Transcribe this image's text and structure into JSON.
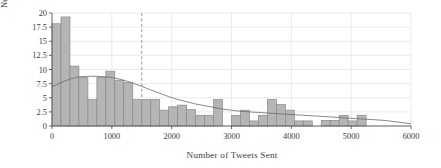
{
  "chart_data": {
    "type": "bar",
    "title": "",
    "subtitle": "",
    "xlabel": "Number of Tweets Sent",
    "ylabel": "Number of Organizations",
    "xlim": [
      0,
      6000
    ],
    "ylim": [
      0,
      20
    ],
    "xticks": [
      0,
      1000,
      2000,
      3000,
      4000,
      5000,
      6000
    ],
    "xtick_labels": [
      "0",
      "1000",
      "2000",
      "3000",
      "4000",
      "5000",
      "6000"
    ],
    "yticks": [
      0,
      2.5,
      5,
      7.5,
      10,
      12.5,
      15,
      17.5,
      20
    ],
    "ytick_labels": [
      "0",
      "2.5",
      "5",
      "7.5",
      "10",
      "12.5",
      "15",
      "17.5",
      "20"
    ],
    "grid": true,
    "grid_axis": "both",
    "bar_fill": "#b5b5b5",
    "bar_edge": "#8a8a8a",
    "curve_color": "#6b6b6b",
    "vline_color": "#9a9a9a",
    "legend": [],
    "legend_position": "none",
    "annotations": [
      {
        "type": "vline",
        "x": 1500,
        "style": "dashed",
        "label": ""
      }
    ],
    "bin_width": 150,
    "bin_edges": [
      0,
      150,
      300,
      450,
      600,
      750,
      900,
      1050,
      1200,
      1350,
      1500,
      1650,
      1800,
      1950,
      2100,
      2250,
      2400,
      2550,
      2700,
      2850,
      3000,
      3150,
      3300,
      3450,
      3600,
      3750,
      3900,
      4050,
      4200,
      4350,
      4500,
      4650,
      4800,
      4950,
      5100,
      5250,
      5400,
      5550,
      5700,
      5850,
      6000
    ],
    "values": [
      18.1,
      19.3,
      10.6,
      8.6,
      4.7,
      8.6,
      9.7,
      8.1,
      7.7,
      4.7,
      4.7,
      4.7,
      2.8,
      3.4,
      3.7,
      2.9,
      1.9,
      1.9,
      4.7,
      0.0,
      1.9,
      2.8,
      0.9,
      1.9,
      4.7,
      3.8,
      2.8,
      0.9,
      0.9,
      0.0,
      1.0,
      1.0,
      1.9,
      0.9,
      1.9,
      0.0,
      0.0,
      0.0,
      0.0,
      0.0
    ],
    "curve": {
      "name": "density-estimate",
      "x": [
        0,
        150,
        300,
        450,
        600,
        750,
        900,
        1050,
        1200,
        1350,
        1500,
        1650,
        1800,
        1950,
        2100,
        2250,
        2400,
        2550,
        2700,
        2850,
        3000,
        3150,
        3300,
        3450,
        3600,
        3750,
        3900,
        4050,
        4200,
        4350,
        4500,
        4650,
        4800,
        4950,
        5100,
        5250,
        5400,
        5550,
        5700,
        5850,
        6000
      ],
      "y": [
        6.9,
        7.7,
        8.3,
        8.7,
        8.8,
        8.8,
        8.7,
        8.5,
        8.1,
        7.6,
        7.0,
        6.4,
        5.8,
        5.2,
        4.7,
        4.3,
        3.9,
        3.6,
        3.3,
        3.0,
        2.8,
        2.6,
        2.5,
        2.4,
        2.3,
        2.2,
        2.1,
        2.0,
        1.9,
        1.8,
        1.7,
        1.6,
        1.5,
        1.4,
        1.3,
        1.2,
        1.1,
        1.0,
        0.8,
        0.6,
        0.4
      ]
    }
  }
}
